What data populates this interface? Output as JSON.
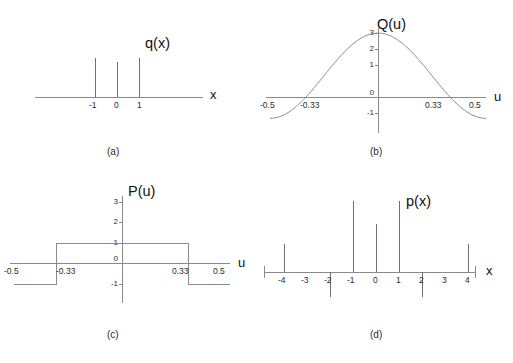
{
  "figure": {
    "panels": [
      {
        "tag": "(a)",
        "function_label": "q(x)",
        "x_axis_label": "x",
        "type": "impulse",
        "xticks": [
          "-1",
          "0",
          "1"
        ],
        "impulses": [
          {
            "x": -1,
            "height": 1.0
          },
          {
            "x": 0,
            "height": 0.82
          },
          {
            "x": 1,
            "height": 1.0
          }
        ]
      },
      {
        "tag": "(b)",
        "function_label": "Q(u)",
        "x_axis_label": "u",
        "type": "line",
        "xticks": [
          "-0.5",
          "-0.33",
          "0",
          "0.33",
          "0.5"
        ],
        "yticks": [
          "3",
          "2",
          "1",
          "0",
          "-1"
        ],
        "curve": "1 + 2cos(2*pi*u)",
        "peak_value": 3,
        "zero_crossings": [
          "-0.33",
          "0.33"
        ],
        "min_value": -1
      },
      {
        "tag": "(c)",
        "function_label": "P(u)",
        "x_axis_label": "u",
        "type": "step",
        "xticks": [
          "-0.5",
          "-0.33",
          "0",
          "0.33",
          "0.5"
        ],
        "yticks": [
          "3",
          "2",
          "1",
          "0",
          "-1"
        ],
        "levels": [
          {
            "from": -0.5,
            "to": -0.33,
            "value": -1
          },
          {
            "from": -0.33,
            "to": 0.33,
            "value": 1
          },
          {
            "from": 0.33,
            "to": 0.5,
            "value": -1
          }
        ]
      },
      {
        "tag": "(d)",
        "function_label": "p(x)",
        "x_axis_label": "x",
        "type": "impulse",
        "xticks": [
          "-4",
          "-3",
          "-2",
          "-1",
          "0",
          "1",
          "2",
          "3",
          "4"
        ],
        "impulses": [
          {
            "x": -4,
            "height": 0.4
          },
          {
            "x": -2,
            "height": -0.36
          },
          {
            "x": -1,
            "height": 1.0
          },
          {
            "x": 0,
            "height": 0.67
          },
          {
            "x": 1,
            "height": 1.0
          },
          {
            "x": 2,
            "height": -0.36
          },
          {
            "x": 4,
            "height": 0.4
          }
        ]
      }
    ]
  },
  "chart_data": {
    "type": "line",
    "title": "",
    "panels": [
      {
        "id": "a",
        "tag": "(a)",
        "type": "bar",
        "title": "q(x)",
        "xlabel": "x",
        "ylabel": "",
        "categories": [
          "-1",
          "0",
          "1"
        ],
        "values": [
          1.0,
          0.82,
          1.0
        ],
        "xlim": [
          -3.2,
          3.2
        ],
        "grid": false,
        "legend": "none"
      },
      {
        "id": "b",
        "tag": "(b)",
        "type": "line",
        "title": "Q(u)",
        "xlabel": "u",
        "ylabel": "",
        "x": [
          -0.5,
          -0.45,
          -0.4,
          -0.33,
          -0.3,
          -0.25,
          -0.2,
          -0.15,
          -0.1,
          -0.05,
          0,
          0.05,
          0.1,
          0.15,
          0.2,
          0.25,
          0.3,
          0.33,
          0.4,
          0.45,
          0.5
        ],
        "y": [
          -1.0,
          -0.62,
          0.38,
          0.0,
          0.38,
          1.0,
          1.62,
          2.18,
          2.62,
          2.9,
          3.0,
          2.9,
          2.62,
          2.18,
          1.62,
          1.0,
          0.38,
          0.0,
          0.38,
          -0.62,
          -1.0
        ],
        "series": [
          {
            "name": "Q(u) = 1 + 2cos(2πu)",
            "values": [
              -1.0,
              -0.62,
              0.38,
              0.0,
              0.38,
              1.0,
              1.62,
              2.18,
              2.62,
              2.9,
              3.0,
              2.9,
              2.62,
              2.18,
              1.62,
              1.0,
              0.38,
              0.0,
              0.38,
              -0.62,
              -1.0
            ]
          }
        ],
        "xticks": [
          -0.5,
          -0.33,
          0,
          0.33,
          0.5
        ],
        "xticklabels": [
          "-0.5",
          "-0.33",
          "0",
          "0.33",
          "0.5"
        ],
        "yticks": [
          -1,
          0,
          1,
          2,
          3
        ],
        "yticklabels": [
          "-1",
          "0",
          "1",
          "2",
          "3"
        ],
        "xlim": [
          -0.58,
          0.58
        ],
        "ylim": [
          -1.5,
          3.2
        ],
        "grid": false,
        "legend": "none"
      },
      {
        "id": "c",
        "tag": "(c)",
        "type": "line",
        "title": "P(u)",
        "xlabel": "u",
        "ylabel": "",
        "x": [
          -0.5,
          -0.33,
          -0.33,
          0.33,
          0.33,
          0.5
        ],
        "y": [
          -1,
          -1,
          1,
          1,
          -1,
          -1
        ],
        "series": [
          {
            "name": "P(u)",
            "values": [
              -1,
              -1,
              1,
              1,
              -1,
              -1
            ]
          }
        ],
        "xticks": [
          -0.5,
          -0.33,
          0,
          0.33,
          0.5
        ],
        "xticklabels": [
          "-0.5",
          "-0.33",
          "0",
          "0.33",
          "0.5"
        ],
        "yticks": [
          -1,
          0,
          1,
          2,
          3
        ],
        "yticklabels": [
          "-1",
          "0",
          "1",
          "2",
          "3"
        ],
        "xlim": [
          -0.58,
          0.58
        ],
        "ylim": [
          -1.5,
          3.2
        ],
        "grid": false,
        "legend": "none"
      },
      {
        "id": "d",
        "tag": "(d)",
        "type": "bar",
        "title": "p(x)",
        "xlabel": "x",
        "ylabel": "",
        "categories": [
          "-4",
          "-3",
          "-2",
          "-1",
          "0",
          "1",
          "2",
          "3",
          "4"
        ],
        "values": [
          0.4,
          0,
          -0.36,
          1.0,
          0.67,
          1.0,
          -0.36,
          0,
          0.4
        ],
        "xlim": [
          -5.2,
          5.2
        ],
        "ylim": [
          -0.5,
          1.15
        ],
        "grid": false,
        "legend": "none"
      }
    ]
  },
  "labels": {
    "qx": "q(x)",
    "Qu": "Q(u)",
    "Pu": "P(u)",
    "px": "p(x)",
    "axis_x": "x",
    "axis_u": "u",
    "tag_a": "(a)",
    "tag_b": "(b)",
    "tag_c": "(c)",
    "tag_d": "(d)",
    "t_m1": "-1",
    "t_0": "0",
    "t_1": "1",
    "t_m05": "-0.5",
    "t_m033": "-0.33",
    "t_033": "0.33",
    "t_05": "0.5",
    "t_y3": "3",
    "t_y2": "2",
    "t_y1": "1",
    "t_y0": "0",
    "t_ym1": "-1",
    "t_m4": "-4",
    "t_m3": "-3",
    "t_m2": "-2",
    "t_2": "2",
    "t_3": "3",
    "t_4": "4"
  },
  "colors": {
    "line": "#8a8a8a",
    "impulse": "#6f6f6f",
    "text": "#1a1a1a",
    "background": "#ffffff"
  }
}
